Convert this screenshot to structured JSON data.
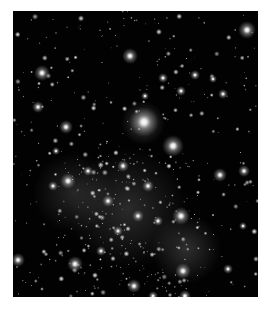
{
  "image": {
    "description": "Grayscale star field / simulated halo density map on black background",
    "background_color": "#020202",
    "frame": {
      "x": 13,
      "y": 11,
      "width": 245,
      "height": 286
    },
    "glows": [
      {
        "x": 115,
        "y": 198,
        "r": 60,
        "o": 0.16
      },
      {
        "x": 173,
        "y": 238,
        "r": 35,
        "o": 0.18
      },
      {
        "x": 60,
        "y": 182,
        "r": 40,
        "o": 0.14
      },
      {
        "x": 130,
        "y": 112,
        "r": 22,
        "o": 0.22
      }
    ],
    "bright_stars": [
      {
        "x": 131,
        "y": 111,
        "r": 15
      },
      {
        "x": 160,
        "y": 135,
        "r": 11
      },
      {
        "x": 234,
        "y": 19,
        "r": 9
      },
      {
        "x": 29,
        "y": 62,
        "r": 8
      },
      {
        "x": 117,
        "y": 45,
        "r": 8
      },
      {
        "x": 53,
        "y": 116,
        "r": 7
      },
      {
        "x": 55,
        "y": 170,
        "r": 8
      },
      {
        "x": 168,
        "y": 205,
        "r": 9
      },
      {
        "x": 25,
        "y": 96,
        "r": 6
      },
      {
        "x": 207,
        "y": 164,
        "r": 7
      },
      {
        "x": 231,
        "y": 160,
        "r": 6
      },
      {
        "x": 62,
        "y": 253,
        "r": 8
      },
      {
        "x": 5,
        "y": 249,
        "r": 7
      },
      {
        "x": 170,
        "y": 260,
        "r": 8
      },
      {
        "x": 121,
        "y": 275,
        "r": 7
      },
      {
        "x": 150,
        "y": 67,
        "r": 5
      },
      {
        "x": 182,
        "y": 64,
        "r": 5
      },
      {
        "x": 200,
        "y": 68,
        "r": 4
      },
      {
        "x": 110,
        "y": 155,
        "r": 6
      },
      {
        "x": 135,
        "y": 175,
        "r": 6
      },
      {
        "x": 95,
        "y": 190,
        "r": 6
      },
      {
        "x": 125,
        "y": 205,
        "r": 6
      },
      {
        "x": 105,
        "y": 220,
        "r": 5
      },
      {
        "x": 145,
        "y": 210,
        "r": 5
      },
      {
        "x": 210,
        "y": 83,
        "r": 5
      },
      {
        "x": 168,
        "y": 80,
        "r": 5
      },
      {
        "x": 132,
        "y": 85,
        "r": 4
      },
      {
        "x": 75,
        "y": 160,
        "r": 5
      },
      {
        "x": 40,
        "y": 175,
        "r": 5
      },
      {
        "x": 43,
        "y": 140,
        "r": 4
      },
      {
        "x": 88,
        "y": 240,
        "r": 5
      },
      {
        "x": 215,
        "y": 258,
        "r": 5
      },
      {
        "x": 230,
        "y": 215,
        "r": 4
      },
      {
        "x": 172,
        "y": 285,
        "r": 6
      },
      {
        "x": 140,
        "y": 285,
        "r": 5
      }
    ],
    "star_field_seed": 20240611,
    "star_field_count": 520
  }
}
